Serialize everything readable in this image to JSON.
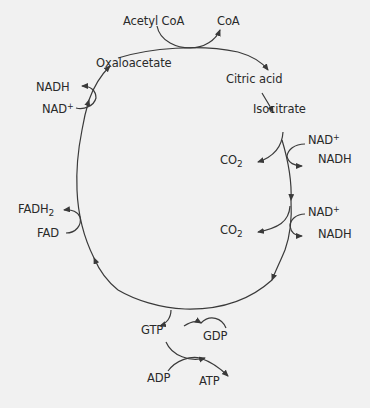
{
  "diagram": {
    "colors": {
      "background": "#f1f1f1",
      "stroke": "#3a3a3a",
      "text": "#2a2a2a"
    },
    "cycle_intermediates": [
      "Oxaloacetate",
      "Citric acid",
      "Isocitrate"
    ],
    "labels": {
      "acetyl_coa": "Acetyl CoA",
      "coa": "CoA",
      "oxaloacetate": "Oxaloacetate",
      "citric_acid": "Citric acid",
      "isocitrate": "Isocitrate",
      "nad_1": "NAD",
      "nadh_1": "NADH",
      "co2_1": "CO",
      "nad_2": "NAD",
      "nadh_2": "NADH",
      "co2_2": "CO",
      "gtp": "GTP",
      "gdp": "GDP",
      "adp": "ADP",
      "atp": "ATP",
      "fadh2": "FADH",
      "fad": "FAD",
      "nadh_3": "NADH",
      "nad_3": "NAD",
      "plus": "+",
      "sub2": "2"
    },
    "reactions": [
      {
        "inputs": [
          "Acetyl CoA",
          "Oxaloacetate"
        ],
        "outputs": [
          "CoA",
          "Citric acid"
        ]
      },
      {
        "inputs": [
          "Citric acid"
        ],
        "outputs": [
          "Isocitrate"
        ]
      },
      {
        "inputs": [
          "Isocitrate",
          "NAD+"
        ],
        "outputs": [
          "CO2",
          "NADH"
        ]
      },
      {
        "inputs": [
          "NAD+"
        ],
        "outputs": [
          "CO2",
          "NADH"
        ]
      },
      {
        "inputs": [
          "GDP"
        ],
        "outputs": [
          "GTP"
        ]
      },
      {
        "inputs": [
          "GTP",
          "ADP"
        ],
        "outputs": [
          "GDP",
          "ATP"
        ]
      },
      {
        "inputs": [
          "FAD"
        ],
        "outputs": [
          "FADH2"
        ]
      },
      {
        "inputs": [
          "NAD+"
        ],
        "outputs": [
          "NADH",
          "Oxaloacetate"
        ]
      }
    ]
  }
}
